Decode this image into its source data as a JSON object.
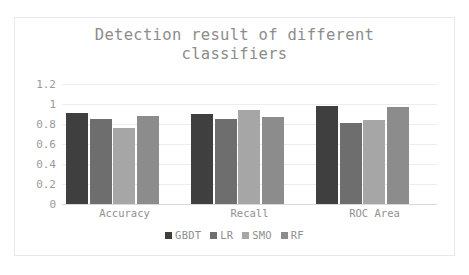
{
  "chart_data": {
    "type": "bar",
    "title": "Detection result of different\nclassifiers",
    "title_line1": "Detection result of different",
    "title_line2": "classifiers",
    "xlabel": "",
    "ylabel": "",
    "categories": [
      "Accuracy",
      "Recall",
      "ROC Area"
    ],
    "ylim": [
      0,
      1.2
    ],
    "yticks": [
      "0",
      "0.2",
      "0.4",
      "0.6",
      "0.8",
      "1",
      "1.2"
    ],
    "ytick_values": [
      0,
      0.2,
      0.4,
      0.6,
      0.8,
      1,
      1.2
    ],
    "grid": true,
    "legend_position": "bottom",
    "series": [
      {
        "name": "GBDT",
        "color": "#3f3f3f",
        "values": [
          0.91,
          0.9,
          0.98
        ]
      },
      {
        "name": "LR",
        "color": "#6e6e6e",
        "values": [
          0.85,
          0.855,
          0.81
        ]
      },
      {
        "name": "SMO",
        "color": "#a6a6a6",
        "values": [
          0.765,
          0.94,
          0.845
        ]
      },
      {
        "name": "RF",
        "color": "#8c8c8c",
        "values": [
          0.885,
          0.875,
          0.975
        ]
      }
    ]
  },
  "figure": {
    "border_color": "#e8e8e8",
    "background": "#ffffff",
    "gridline_color": "#ededed",
    "axis_color": "#d9d9d9",
    "text_color": "#8f8f8f",
    "title_color": "#8c8c8c"
  }
}
